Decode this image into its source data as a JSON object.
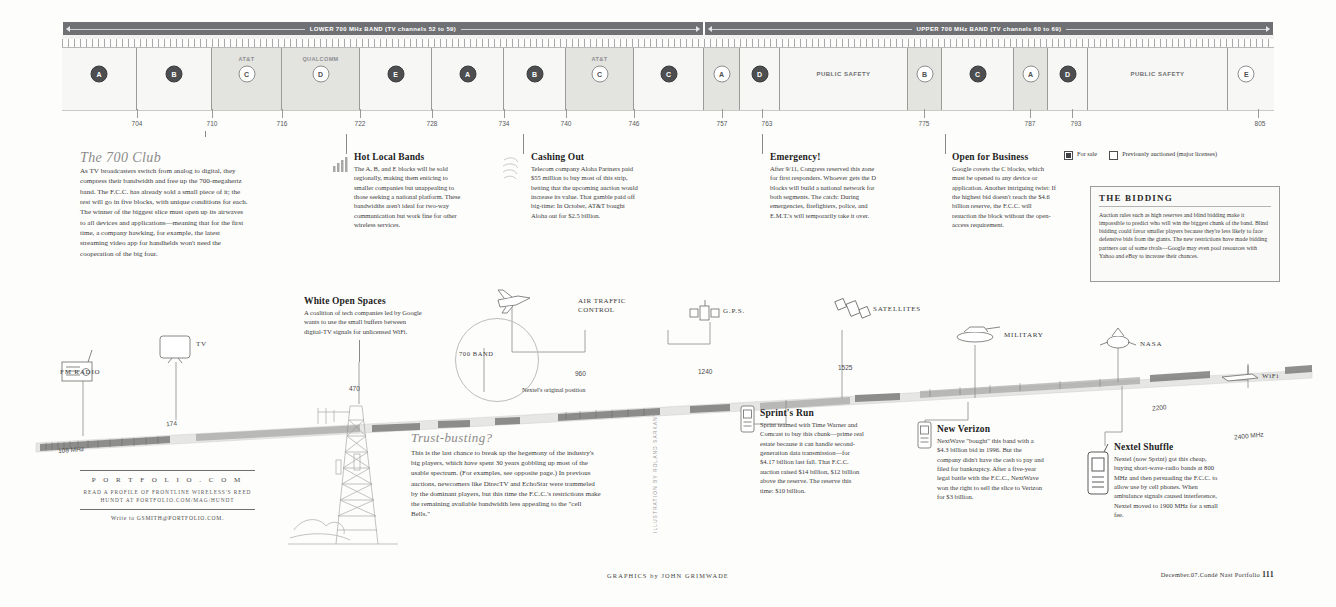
{
  "bands": [
    {
      "label": "LOWER 700 MHz BAND (TV channels 52 to 59)"
    },
    {
      "label": "UPPER 700 MHz BAND (TV channels 60 to 69)"
    }
  ],
  "spectrum_blocks": [
    {
      "letter": "A",
      "owner": "",
      "state": "sale"
    },
    {
      "letter": "B",
      "owner": "",
      "state": "sale"
    },
    {
      "letter": "C",
      "owner": "AT&T",
      "state": "prev"
    },
    {
      "letter": "D",
      "owner": "QUALCOMM",
      "state": "prev"
    },
    {
      "letter": "E",
      "owner": "",
      "state": "sale"
    },
    {
      "letter": "A",
      "owner": "",
      "state": "sale"
    },
    {
      "letter": "B",
      "owner": "",
      "state": "sale"
    },
    {
      "letter": "C",
      "owner": "AT&T",
      "state": "prev"
    },
    {
      "letter": "C",
      "owner": "",
      "state": "sale"
    },
    {
      "letter": "A",
      "owner": "",
      "state": "prev"
    },
    {
      "letter": "D",
      "owner": "",
      "state": "sale"
    },
    {
      "letter": "PUBLIC SAFETY",
      "owner": "",
      "state": "psafe"
    },
    {
      "letter": "B",
      "owner": "",
      "state": "prev"
    },
    {
      "letter": "C",
      "owner": "",
      "state": "sale"
    },
    {
      "letter": "A",
      "owner": "",
      "state": "prev"
    },
    {
      "letter": "D",
      "owner": "",
      "state": "sale"
    },
    {
      "letter": "PUBLIC SAFETY",
      "owner": "",
      "state": "psafe"
    },
    {
      "letter": "E",
      "owner": "",
      "state": "prev"
    }
  ],
  "axis_ticks": [
    "704",
    "710",
    "716",
    "722",
    "728",
    "734",
    "740",
    "746",
    "757",
    "763",
    "775",
    "787",
    "793",
    "805"
  ],
  "callouts": {
    "club": {
      "title": "The 700 Club",
      "body": "As TV broadcasters switch from analog to digital, they compress their bandwidth and free up the 700-megahertz band. The F.C.C. has already sold a small piece of it; the rest will go in five blocks, with unique conditions for each. The winner of the biggest slice must open up its airwaves to all devices and applications—meaning that for the first time, a company hawking, for example, the latest streaming video app for handhelds won't need the cooperation of the big four."
    },
    "hot_local": {
      "title": "Hot Local Bands",
      "body": "The A, B, and E blocks will be sold regionally, making them enticing to smaller companies but unappealing to those seeking a national platform. These bandwidths aren't ideal for two-way communication but work fine for other wireless services."
    },
    "cashing_out": {
      "title": "Cashing Out",
      "body": "Telecom company Aloha Partners paid $55 million to buy most of this strip, betting that the upcoming auction would increase its value. That gamble paid off big-time: In October, AT&T bought Aloha out for $2.5 billion."
    },
    "emergency": {
      "title": "Emergency!",
      "body": "After 9/11, Congress reserved this zone for first responders. Whoever gets the D blocks will build a national network for both segments. The catch: During emergencies, firefighters, police, and E.M.T.'s will temporarily take it over."
    },
    "open_business": {
      "title": "Open for Business",
      "body": "Google covets the C blocks, which must be opened to any device or application. Another intriguing twist: If the highest bid doesn't reach the $4.6 billion reserve, the F.C.C. will reauction the block without the open-access requirement."
    },
    "white_spaces": {
      "title": "White Open Spaces",
      "body": "A coalition of tech companies led by Google wants to use the small buffers between digital-TV signals for unlicensed WiFi."
    },
    "trust_busting": {
      "title": "Trust-busting?",
      "body": "This is the last chance to break up the hegemony of the industry's big players, which have spent 30 years gobbling up most of the usable spectrum. (For examples, see opposite page.) In previous auctions, newcomers like DirecTV and EchoStar were trammeled by the dominant players, but this time the F.C.C.'s restrictions make the remaining available bandwidth less appealing to the \"cell Bells.\""
    },
    "sprints_run": {
      "title": "Sprint's Run",
      "body": "Sprint teamed with Time Warner and Comcast to buy this chunk—prime real estate because it can handle second-generation data transmission—for $4.17 billion last fall. That F.C.C. auction raised $14 billion, $12 billion above the reserve. The reserve this time: $10 billion."
    },
    "new_verizon": {
      "title": "New Verizon",
      "body": "NextWave \"bought\" this band with a $4.3 billion bid in 1996. But the company didn't have the cash to pay and filed for bankruptcy. After a five-year legal battle with the F.C.C., NextWave won the right to sell the slice to Verizon for $3 billion."
    },
    "nextel_shuffle": {
      "title": "Nextel Shuffle",
      "body": "Nextel (now Sprint) got this cheap, buying short-wave-radio bands at 800 MHz and then persuading the F.C.C. to allow use by cell phones. When ambulance signals caused interference, Nextel moved to 1900 MHz for a small fee."
    }
  },
  "legend": {
    "for_sale": "For sale",
    "previously_auctioned": "Previously auctioned (major licenses)"
  },
  "bidding": {
    "title": "THE BIDDING",
    "body": "Auction rules such as high reserves and blind bidding make it impossible to predict who will win the biggest chunk of the band. Blind bidding could favor smaller players because they're less likely to face defensive bids from the giants. The new restrictions have made bidding partners out of some rivals—Google may even pool resources with Yahoo and eBay to increase their chances."
  },
  "sweep": {
    "devices": [
      {
        "name": "FM RADIO",
        "freq": "108 MHz"
      },
      {
        "name": "TV",
        "freq": "174"
      },
      {
        "name": "700 BAND",
        "freq": "470"
      },
      {
        "name": "AIR TRAFFIC CONTROL",
        "freq": "960"
      },
      {
        "name": "G.P.S.",
        "freq": "1240"
      },
      {
        "name": "SATELLITES",
        "freq": "1525"
      },
      {
        "name": "MILITARY",
        "freq": ""
      },
      {
        "name": "NASA",
        "freq": "2200"
      },
      {
        "name": "WiFi",
        "freq": "2400 MHz"
      }
    ],
    "nextel_note": "Nextel's original position"
  },
  "promo": {
    "brand": "P O R T F O L I O . C O M",
    "sub": "READ A PROFILE OF FRONTLINE WIRELESS'S REED HUNDT AT PORTFOLIO.COM/MAG/HUNDT",
    "write": "Write to GSMITH@PORTFOLIO.COM."
  },
  "credits": {
    "illustration": "ILLUSTRATION BY ROLAND SARKANY",
    "graphics": "GRAPHICS by JOHN GRIMWADE",
    "issue_prefix": "December.07.Condé Nast Portfolio ",
    "page_number": "111"
  }
}
